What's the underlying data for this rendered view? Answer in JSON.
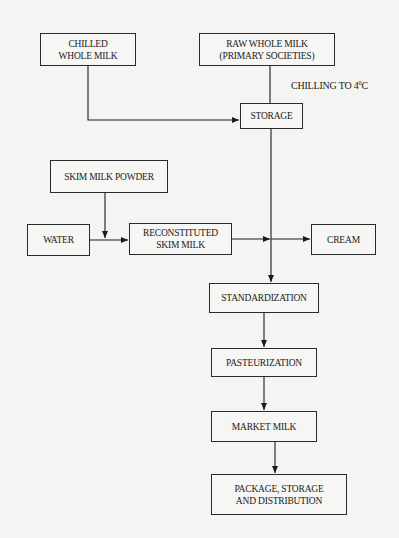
{
  "diagram": {
    "type": "flowchart",
    "nodes": {
      "chilled_whole_milk": "CHILLED\nWHOLE MILK",
      "raw_whole_milk": "RAW WHOLE MILK\n(PRIMARY SOCIETIES)",
      "storage": "STORAGE",
      "skim_milk_powder": "SKIM MILK POWDER",
      "water": "WATER",
      "reconstituted": "RECONSTITUTED\nSKIM MILK",
      "cream": "CREAM",
      "standardization": "STANDARDIZATION",
      "pasteurization": "PASTEURIZATION",
      "market_milk": "MARKET MILK",
      "package": "PACKAGE, STORAGE\nAND DISTRIBUTION"
    },
    "annotations": {
      "chilling_text": "CHILLING TO 4",
      "chilling_sup": "0",
      "chilling_unit": "C"
    },
    "edges": [
      {
        "from": "chilled_whole_milk",
        "to": "storage"
      },
      {
        "from": "raw_whole_milk",
        "to": "storage",
        "label": "CHILLING TO 4°C"
      },
      {
        "from": "skim_milk_powder",
        "to": "reconstituted"
      },
      {
        "from": "water",
        "to": "reconstituted"
      },
      {
        "from": "reconstituted",
        "to": "standardization"
      },
      {
        "from": "storage",
        "to": "standardization"
      },
      {
        "from": "standardization",
        "to": "cream"
      },
      {
        "from": "standardization",
        "to": "pasteurization"
      },
      {
        "from": "pasteurization",
        "to": "market_milk"
      },
      {
        "from": "market_milk",
        "to": "package"
      }
    ]
  }
}
